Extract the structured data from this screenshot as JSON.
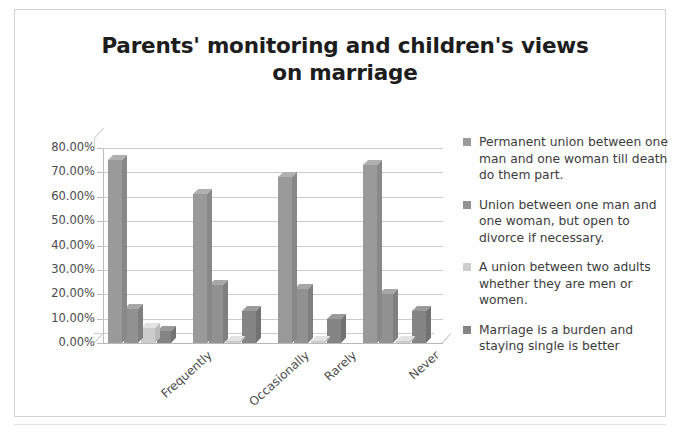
{
  "chart_data": {
    "type": "bar",
    "title": "Parents' monitoring and children's views on marriage",
    "title_line1": "Parents' monitoring and children's views",
    "title_line2": "on marriage",
    "xlabel": "",
    "ylabel": "",
    "ylim": [
      0,
      80
    ],
    "ytick_step": 10,
    "grid": true,
    "legend_position": "right",
    "categories": [
      "Frequently",
      "Occasionally",
      "Rarely",
      "Never"
    ],
    "ytick_labels": [
      "80.00%",
      "70.00%",
      "60.00%",
      "50.00%",
      "40.00%",
      "30.00%",
      "20.00%",
      "10.00%",
      "0.00%"
    ],
    "ytick_values": [
      80,
      70,
      60,
      50,
      40,
      30,
      20,
      10,
      0
    ],
    "series": [
      {
        "name": "Permanent union between one man and one woman till death do them part.",
        "color": "#9a9a9a",
        "values": [
          75,
          61,
          68,
          73
        ]
      },
      {
        "name": "Union between one man and one woman, but open to divorce if necessary.",
        "color": "#919191",
        "values": [
          14,
          24,
          22,
          20
        ]
      },
      {
        "name": "A union between two adults whether they are men or women.",
        "color": "#cccccc",
        "values": [
          6,
          1,
          1,
          1
        ]
      },
      {
        "name": "Marriage is a burden and staying single is better",
        "color": "#848484",
        "values": [
          5,
          13,
          10,
          13
        ]
      }
    ]
  },
  "legend": {
    "items": [
      {
        "label": "Permanent union between one man and one woman till death do them part.",
        "color": "#9a9a9a"
      },
      {
        "label": "Union between one man and one woman, but open to divorce if necessary.",
        "color": "#919191"
      },
      {
        "label": "A union between two adults whether they are men or women.",
        "color": "#cccccc"
      },
      {
        "label": "Marriage is a burden and staying single is better",
        "color": "#848484"
      }
    ]
  }
}
